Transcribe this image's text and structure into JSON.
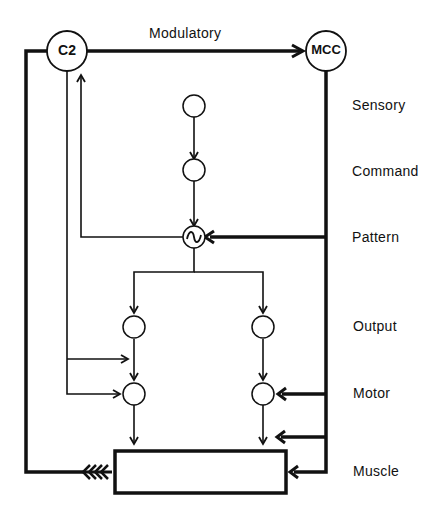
{
  "diagram": {
    "type": "neural circuit block diagram",
    "colors": {
      "line": "#111111",
      "background": "#ffffff"
    },
    "nodes": {
      "c2": {
        "label": "C2"
      },
      "mcc": {
        "label": "MCC"
      },
      "sensory_neuron": {
        "label": ""
      },
      "command_neuron": {
        "label": ""
      },
      "pattern_oscillator": {
        "label": "",
        "glyph": "∿"
      },
      "output_left": {
        "label": ""
      },
      "output_right": {
        "label": ""
      },
      "motor_left": {
        "label": ""
      },
      "motor_right": {
        "label": ""
      },
      "muscle": {
        "label": ""
      }
    },
    "edge_labels": {
      "modulatory": "Modulatory"
    },
    "level_labels": [
      {
        "id": "sensory",
        "text": "Sensory"
      },
      {
        "id": "command",
        "text": "Command"
      },
      {
        "id": "pattern",
        "text": "Pattern"
      },
      {
        "id": "output",
        "text": "Output"
      },
      {
        "id": "motor",
        "text": "Motor"
      },
      {
        "id": "muscle",
        "text": "Muscle"
      }
    ],
    "edges": [
      {
        "from": "C2",
        "to": "MCC",
        "style": "thick",
        "label": "Modulatory"
      },
      {
        "from": "sensory_neuron",
        "to": "command_neuron",
        "style": "thin"
      },
      {
        "from": "command_neuron",
        "to": "pattern_oscillator",
        "style": "thin"
      },
      {
        "from": "pattern_oscillator",
        "to": "C2",
        "style": "thin"
      },
      {
        "from": "MCC",
        "to": "pattern_oscillator",
        "style": "thick"
      },
      {
        "from": "pattern_oscillator",
        "to": "output_left",
        "style": "thin"
      },
      {
        "from": "pattern_oscillator",
        "to": "output_right",
        "style": "thin"
      },
      {
        "from": "C2",
        "to": "motor_left_input",
        "style": "thin"
      },
      {
        "from": "C2",
        "to": "motor_left",
        "style": "thin"
      },
      {
        "from": "output_left",
        "to": "motor_left",
        "style": "thin"
      },
      {
        "from": "output_right",
        "to": "motor_right",
        "style": "thin"
      },
      {
        "from": "MCC",
        "to": "motor_right",
        "style": "thick"
      },
      {
        "from": "MCC",
        "to": "motor_right_output",
        "style": "thick"
      },
      {
        "from": "MCC",
        "to": "muscle",
        "style": "thick"
      },
      {
        "from": "motor_left",
        "to": "muscle",
        "style": "thin"
      },
      {
        "from": "motor_right",
        "to": "muscle",
        "style": "thin"
      },
      {
        "from": "muscle",
        "to": "C2",
        "style": "thick-feathered"
      }
    ]
  }
}
